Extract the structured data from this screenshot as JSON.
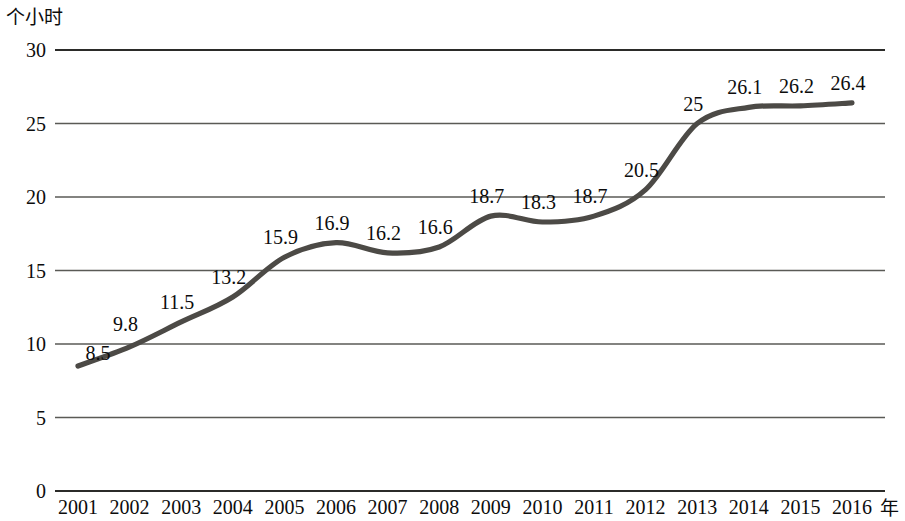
{
  "chart_data": {
    "type": "line",
    "title": "",
    "subtitle": "",
    "xlabel": "年",
    "ylabel": "个小时",
    "categories": [
      "2001",
      "2002",
      "2003",
      "2004",
      "2005",
      "2006",
      "2007",
      "2008",
      "2009",
      "2010",
      "2011",
      "2012",
      "2013",
      "2014",
      "2015",
      "2016"
    ],
    "values": [
      8.5,
      9.8,
      11.5,
      13.2,
      15.9,
      16.9,
      16.2,
      16.6,
      18.7,
      18.3,
      18.7,
      20.5,
      25,
      26.1,
      26.2,
      26.4
    ],
    "point_labels": [
      "8.5",
      "9.8",
      "11.5",
      "13.2",
      "15.9",
      "16.9",
      "16.2",
      "16.6",
      "18.7",
      "18.3",
      "18.7",
      "20.5",
      "25",
      "26.1",
      "26.2",
      "26.4"
    ],
    "ylim": [
      0,
      30
    ],
    "y_ticks": [
      0,
      5,
      10,
      15,
      20,
      25,
      30
    ],
    "y_tick_labels": [
      "0",
      "5",
      "10",
      "15",
      "20",
      "25",
      "30"
    ],
    "grid": true,
    "grid_axis": "y",
    "legend": "none",
    "series": [
      {
        "name": "",
        "values": [
          8.5,
          9.8,
          11.5,
          13.2,
          15.9,
          16.9,
          16.2,
          16.6,
          18.7,
          18.3,
          18.7,
          20.5,
          25,
          26.1,
          26.2,
          26.4
        ]
      }
    ],
    "colors": {
      "line": "#4c4a46",
      "grid": "#5a5a56",
      "axis": "#2b2b29",
      "text": "#0c0c0c",
      "background": "#ffffff"
    }
  }
}
